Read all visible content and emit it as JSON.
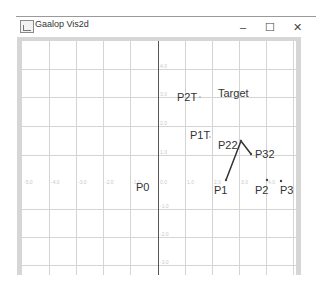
{
  "window": {
    "title": "Gaalop Vis2d",
    "app_icon": "chart-icon",
    "controls": {
      "minimize": "–",
      "maximize": "☐",
      "close": "✕"
    }
  },
  "plot": {
    "x_ticks": [
      "-5.0",
      "-4.0",
      "-3.0",
      "-2.0",
      "-1.0",
      "0.0",
      "1.0",
      "2.0",
      "3.0",
      "4.0"
    ],
    "y_ticks": [
      "4.0",
      "3.0",
      "2.0",
      "1.0",
      "0.0",
      "-1.0",
      "-2.0",
      "-3.0"
    ],
    "labels": {
      "p0": "P0",
      "p1": "P1",
      "p2": "P2",
      "p3": "P3",
      "p22": "P22",
      "p32": "P32",
      "p1t": "P1T",
      "p2t": "P2T",
      "target": "Target"
    },
    "grid_color": "#d0d0d0",
    "axis_color": "#555555",
    "line_color": "#333333"
  }
}
